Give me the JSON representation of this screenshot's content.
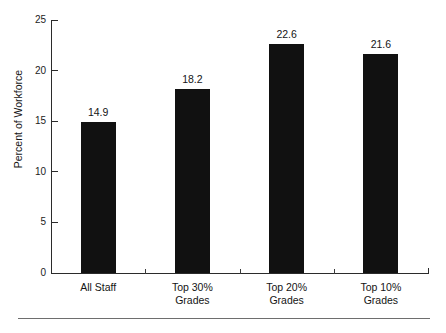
{
  "chart_data": {
    "type": "bar",
    "title": "",
    "subtitle": "",
    "xlabel": "",
    "ylabel": "Percent of Workforce",
    "categories": [
      "All Staff",
      "Top 30% Grades",
      "Top 20% Grades",
      "Top 10% Grades"
    ],
    "category_lines": [
      [
        "All Staff"
      ],
      [
        "Top 30%",
        "Grades"
      ],
      [
        "Top 20%",
        "Grades"
      ],
      [
        "Top 10%",
        "Grades"
      ]
    ],
    "values": [
      14.9,
      18.2,
      22.6,
      21.6
    ],
    "value_labels": [
      "14.9",
      "18.2",
      "22.6",
      "21.6"
    ],
    "ylim": [
      0,
      25
    ],
    "yticks": [
      0,
      5,
      10,
      15,
      20,
      25
    ],
    "ytick_labels": [
      "0",
      "5",
      "10",
      "15",
      "20",
      "25"
    ],
    "grid": false,
    "legend": null,
    "bar_color": "#111111",
    "axis_color": "#2b2b2b",
    "text_color": "#141414",
    "background_color": "#ffffff",
    "annotations": []
  },
  "figure": {
    "bottom_rule_color": "#6e6e6e"
  }
}
